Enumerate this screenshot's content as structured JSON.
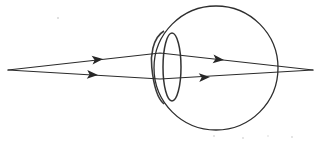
{
  "figure": {
    "type": "optical-ray-diagram",
    "canvas": {
      "width": 316,
      "height": 143,
      "background": "#ffffff"
    },
    "stroke_color": "#2b2b2b",
    "ink_color_globe": "#2e2e2e",
    "ink_color_lens": "#333333"
  },
  "eyeball": {
    "label": "eyeball-globe",
    "shape": "circle",
    "center_x": 216,
    "center_y": 68,
    "radius": 62
  },
  "cornea": {
    "label": "cornea-arc",
    "shape": "arc",
    "apex_x": 152,
    "top_x": 164,
    "top_y": 31,
    "bottom_x": 164,
    "bottom_y": 104
  },
  "lens": {
    "label": "crystalline-lens",
    "shape": "ellipse",
    "center_x": 172,
    "center_y": 67,
    "radius_x": 9,
    "radius_y": 34
  },
  "rays": {
    "source_point": {
      "x": 8,
      "y": 70
    },
    "focus_point": {
      "x": 313,
      "y": 70
    },
    "items": [
      {
        "name": "upper-ray",
        "points": "8,70 160,53 313,70",
        "arrow_positions": [
          {
            "x": 103,
            "y": 59,
            "angle": -6.5
          },
          {
            "x": 224,
            "y": 60,
            "angle": 6.3
          }
        ]
      },
      {
        "name": "lower-ray",
        "points": "8,70 160,79 313,70",
        "arrow_positions": [
          {
            "x": 98,
            "y": 75,
            "angle": 3.4
          },
          {
            "x": 210,
            "y": 77,
            "angle": -3.4
          }
        ]
      }
    ]
  },
  "specks": [
    {
      "x": 58,
      "y": 18,
      "r": 1.1
    },
    {
      "x": 214,
      "y": 136,
      "r": 0.9
    },
    {
      "x": 243,
      "y": 138,
      "r": 0.9
    },
    {
      "x": 268,
      "y": 136,
      "r": 0.8
    },
    {
      "x": 292,
      "y": 137,
      "r": 0.9
    }
  ]
}
